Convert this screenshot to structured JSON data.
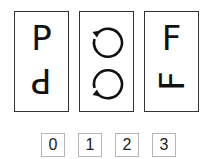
{
  "puzzle": {
    "panels": [
      {
        "top_glyph": "P",
        "bottom_glyph": "P",
        "bottom_transform": "rotate-180",
        "description": "letter P with its 180-degree rotation below"
      },
      {
        "top_icon": "clockwise-circular-arrow",
        "bottom_icon": "counterclockwise-circular-arrow",
        "description": "circular arrow with its vertical mirror below"
      },
      {
        "top_glyph": "F",
        "bottom_glyph": "F",
        "bottom_transform": "rotate-90-ccw",
        "description": "letter F with a rotated F below"
      }
    ],
    "options": [
      "0",
      "1",
      "2",
      "3"
    ],
    "colors": {
      "panel_border": "#333333",
      "option_border": "#b5b5b5",
      "glyph": "#111111"
    }
  }
}
